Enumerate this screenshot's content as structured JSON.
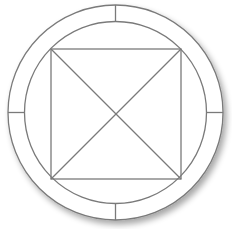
{
  "diagram": {
    "colors": {
      "background": "#ffffff",
      "stroke": "#7a7a7a",
      "fill": "#ffffff",
      "shadow": "#bdbdbd"
    },
    "center": {
      "x": 115.5,
      "y": 112.5
    },
    "outer_circle": {
      "r": 107.5
    },
    "inner_circle": {
      "r": 91
    },
    "square": {
      "x1": 51,
      "y1": 49,
      "x2": 181,
      "y2": 179
    },
    "ticks": [
      "top",
      "right",
      "bottom",
      "left"
    ]
  }
}
